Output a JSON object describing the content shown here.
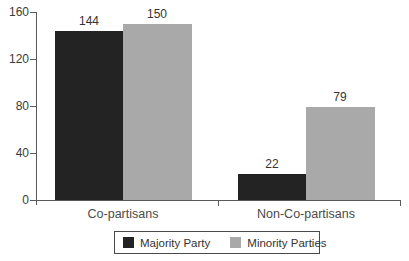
{
  "chart_data": {
    "type": "bar",
    "categories": [
      "Co-partisans",
      "Non-Co-partisans"
    ],
    "series": [
      {
        "name": "Majority Party",
        "color": "#232323",
        "values": [
          144,
          22
        ]
      },
      {
        "name": "Minority Parties",
        "color": "#a9a9a9",
        "values": [
          150,
          79
        ]
      }
    ],
    "yticks": [
      0,
      40,
      80,
      120,
      160
    ],
    "ylim": [
      0,
      160
    ],
    "xlabel": "",
    "ylabel": "",
    "title": "",
    "grid": false,
    "value_labels": true,
    "legend_position": "bottom"
  },
  "colors": {
    "axis": "#5a5a5a",
    "text": "#3a3a3a",
    "background": "#ffffff"
  }
}
